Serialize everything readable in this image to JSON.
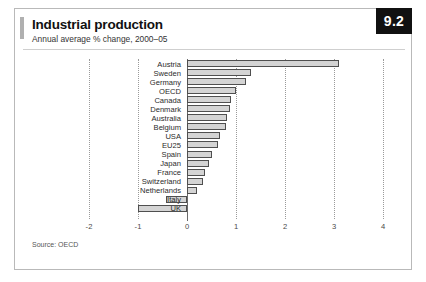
{
  "figure": {
    "badge": "9.2",
    "title": "Industrial production",
    "subtitle": "Annual average % change, 2000–05",
    "source": "Source: OECD"
  },
  "chart_data": {
    "type": "bar",
    "orientation": "horizontal",
    "title": "Industrial production",
    "subtitle": "Annual average % change, 2000–05",
    "xlabel": "",
    "ylabel": "",
    "xlim": [
      -2,
      4
    ],
    "xticks": [
      -2,
      -1,
      0,
      1,
      2,
      3,
      4
    ],
    "xtick_labels": [
      "-2",
      "-1",
      "0",
      "1",
      "2",
      "3",
      "4"
    ],
    "grid": true,
    "legend": false,
    "bar_fill": "#d4d4d4",
    "bar_edge": "#4f4f4f",
    "categories": [
      "Austria",
      "Sweden",
      "Germany",
      "OECD",
      "Canada",
      "Denmark",
      "Australia",
      "Belgium",
      "USA",
      "EU25",
      "Spain",
      "Japan",
      "France",
      "Switzerland",
      "Netherlands",
      "Italy",
      "UK"
    ],
    "values": [
      3.1,
      1.3,
      1.2,
      1.0,
      0.9,
      0.88,
      0.82,
      0.8,
      0.68,
      0.63,
      0.5,
      0.45,
      0.37,
      0.33,
      0.2,
      -0.42,
      -1.0
    ],
    "source": "Source: OECD"
  }
}
